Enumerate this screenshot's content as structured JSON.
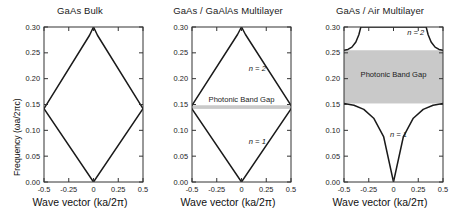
{
  "figure": {
    "axis_labels": {
      "x": "Wave vector (ka/2π)",
      "y": "Frequency (ωa/2πc)"
    },
    "colors": {
      "band_gap_fill": "#c9c9c9",
      "curve": "#1a1a1a",
      "frame": "#333333"
    }
  },
  "chart_data": [
    {
      "type": "line",
      "title": "GaAs Bulk",
      "xlabel": "Wave vector (ka/2π)",
      "ylabel": "Frequency (ωa/2πc)",
      "xlim": [
        -0.5,
        0.5
      ],
      "ylim": [
        0.0,
        0.3
      ],
      "xticks": [
        -0.5,
        -0.25,
        0,
        0.25,
        0.5
      ],
      "xticklabels": [
        "-0.5",
        "-0.25",
        "0",
        "0.25",
        "0.5"
      ],
      "yticks": [
        0.0,
        0.05,
        0.1,
        0.15,
        0.2,
        0.25,
        0.3
      ],
      "yticklabels": [
        "0.00",
        "0.05",
        "0.10",
        "0.15",
        "0.20",
        "0.25",
        "0.30"
      ],
      "grid": false,
      "legend": "none",
      "band_gap": null,
      "annotations": [],
      "series": [
        {
          "name": "folded-light-line-rising",
          "x": [
            -0.5,
            0.0,
            0.5
          ],
          "y": [
            0.142,
            0.0,
            0.142
          ]
        },
        {
          "name": "folded-light-line-falling",
          "x": [
            -0.5,
            -0.04,
            0.0,
            0.04,
            0.5
          ],
          "y": [
            0.142,
            0.284,
            0.3,
            0.284,
            0.142
          ]
        }
      ]
    },
    {
      "type": "line",
      "title": "GaAs / GaAlAs Multilayer",
      "xlabel": "Wave vector (ka/2π)",
      "ylabel": "Frequency (ωa/2πc)",
      "xlim": [
        -0.5,
        0.5
      ],
      "ylim": [
        0.0,
        0.3
      ],
      "xticks": [
        -0.5,
        -0.25,
        0,
        0.25,
        0.5
      ],
      "xticklabels": [
        "-0.5",
        "-0.25",
        "0",
        "0.25",
        "0.5"
      ],
      "yticks": [
        0.0,
        0.05,
        0.1,
        0.15,
        0.2,
        0.25,
        0.3
      ],
      "yticklabels": [
        "0.00",
        "0.05",
        "0.10",
        "0.15",
        "0.20",
        "0.25",
        "0.30"
      ],
      "grid": false,
      "legend": "none",
      "band_gap": {
        "label": "Photonic Band Gap",
        "y_bottom": 0.1415,
        "y_top": 0.1485,
        "label_y": 0.155
      },
      "annotations": [
        {
          "text": "n = 2",
          "x": 0.16,
          "y": 0.215
        },
        {
          "text": "n = 1",
          "x": 0.16,
          "y": 0.073
        }
      ],
      "series": [
        {
          "name": "n = 1",
          "x": [
            -0.5,
            0.0,
            0.5
          ],
          "y": [
            0.1415,
            0.0,
            0.1415
          ]
        },
        {
          "name": "n = 2",
          "x": [
            -0.5,
            -0.04,
            0.0,
            0.04,
            0.5
          ],
          "y": [
            0.1485,
            0.2855,
            0.3,
            0.2855,
            0.1485
          ]
        }
      ]
    },
    {
      "type": "line",
      "title": "GaAs / Air Multilayer",
      "xlabel": "Wave vector (ka/2π)",
      "ylabel": "Frequency (ωa/2πc)",
      "xlim": [
        -0.5,
        0.5
      ],
      "ylim": [
        0.0,
        0.3
      ],
      "xticks": [
        -0.5,
        -0.25,
        0,
        0.25,
        0.5
      ],
      "xticklabels": [
        "-0.5",
        "-0.25",
        "0",
        "0.25",
        "0.5"
      ],
      "yticks": [
        0.0,
        0.05,
        0.1,
        0.15,
        0.2,
        0.25,
        0.3
      ],
      "yticklabels": [
        "0.00",
        "0.05",
        "0.10",
        "0.15",
        "0.20",
        "0.25",
        "0.30"
      ],
      "grid": false,
      "legend": "none",
      "band_gap": {
        "label": "Photonic Band Gap",
        "y_bottom": 0.152,
        "y_top": 0.255,
        "label_y": 0.203
      },
      "annotations": [
        {
          "text": "n = 2",
          "x": 0.225,
          "y": 0.284
        },
        {
          "text": "n = 1",
          "x": 0.05,
          "y": 0.088
        }
      ],
      "series": [
        {
          "name": "n = 1",
          "x": [
            -0.5,
            -0.4,
            -0.3,
            -0.2,
            -0.1,
            0.0,
            0.1,
            0.2,
            0.3,
            0.4,
            0.5
          ],
          "y": [
            0.152,
            0.1485,
            0.1405,
            0.1235,
            0.088,
            0.0,
            0.088,
            0.1235,
            0.1405,
            0.1485,
            0.152
          ]
        },
        {
          "name": "n = 2",
          "x": [
            -0.5,
            -0.46,
            -0.42,
            -0.38,
            -0.35,
            -0.33,
            0.33,
            0.35,
            0.38,
            0.42,
            0.46,
            0.5
          ],
          "y": [
            0.255,
            0.2565,
            0.261,
            0.271,
            0.285,
            0.3,
            0.3,
            0.285,
            0.271,
            0.261,
            0.2565,
            0.255
          ]
        }
      ]
    }
  ]
}
